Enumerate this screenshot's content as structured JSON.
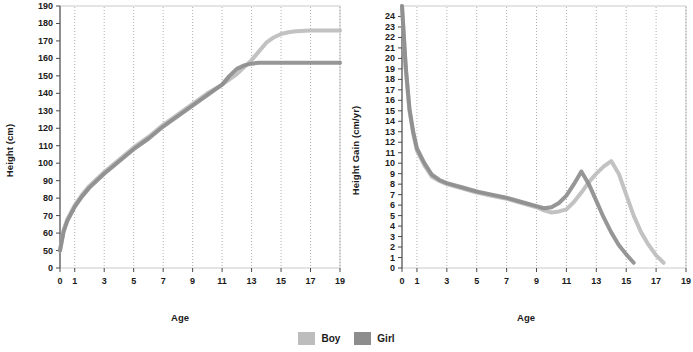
{
  "legend": {
    "items": [
      {
        "name": "Boy",
        "color": "#bdbdbd"
      },
      {
        "name": "Girl",
        "color": "#8d8d8d"
      }
    ]
  },
  "charts": [
    {
      "id": "height-chart",
      "ylabel": "Height (cm)",
      "xlabel": "Age"
    },
    {
      "id": "height-gain-chart",
      "ylabel": "Height Gain (cm/yr)",
      "xlabel": "Age"
    }
  ],
  "chart_data": [
    {
      "type": "line",
      "title": "",
      "xlabel": "Age",
      "ylabel": "Height (cm)",
      "xlim": [
        0,
        19
      ],
      "ylim": [
        0,
        195
      ],
      "yticks": [
        0,
        50,
        60,
        70,
        80,
        90,
        100,
        110,
        120,
        130,
        140,
        150,
        160,
        170,
        180,
        190
      ],
      "xticks": [
        0,
        1,
        3,
        5,
        7,
        9,
        11,
        13,
        15,
        17,
        19
      ],
      "grid": "vertical-dotted",
      "legend_position": "bottom-center",
      "x": [
        0,
        0.25,
        0.5,
        0.75,
        1,
        1.5,
        2,
        3,
        4,
        5,
        6,
        7,
        8,
        9,
        10,
        11,
        11.5,
        12,
        12.5,
        13,
        13.5,
        14,
        14.5,
        15,
        15.5,
        16,
        17,
        18,
        19
      ],
      "series": [
        {
          "name": "Boy",
          "color": "#bdbdbd",
          "values": [
            50,
            62,
            68,
            72,
            76,
            82,
            87,
            95,
            102,
            109,
            115,
            122,
            128,
            134,
            140,
            145,
            148,
            151,
            155,
            159,
            164,
            169,
            172,
            174,
            175,
            175.5,
            176,
            176,
            176
          ]
        },
        {
          "name": "Girl",
          "color": "#8d8d8d",
          "values": [
            50,
            61,
            67,
            71,
            75,
            81,
            86,
            94,
            101,
            108,
            114,
            121,
            127,
            133,
            139,
            145,
            150,
            154,
            156,
            157,
            157.5,
            157.5,
            157.5,
            157.5,
            157.5,
            157.5,
            157.5,
            157.5,
            157.5
          ]
        }
      ]
    },
    {
      "type": "line",
      "title": "",
      "xlabel": "Age",
      "ylabel": "Height Gain (cm/yr)",
      "xlim": [
        0,
        19
      ],
      "ylim": [
        0,
        25
      ],
      "yticks": [
        0,
        1,
        2,
        3,
        4,
        5,
        6,
        7,
        8,
        9,
        10,
        11,
        12,
        13,
        14,
        15,
        16,
        17,
        18,
        19,
        20,
        21,
        22,
        23,
        24
      ],
      "xticks": [
        0,
        1,
        3,
        5,
        7,
        9,
        11,
        13,
        15,
        17,
        19
      ],
      "grid": "vertical-dotted",
      "legend_position": "bottom-center",
      "x": [
        0,
        0.25,
        0.5,
        0.75,
        1,
        1.5,
        2,
        2.5,
        3,
        4,
        5,
        6,
        7,
        8,
        9,
        9.5,
        10,
        10.5,
        11,
        11.5,
        12,
        12.5,
        13,
        13.5,
        14,
        14.5,
        15,
        15.5,
        16,
        16.5,
        17,
        17.5
      ],
      "series": [
        {
          "name": "Boy",
          "color": "#bdbdbd",
          "values": [
            25,
            19,
            15,
            12.8,
            11.2,
            9.8,
            8.7,
            8.3,
            8.0,
            7.6,
            7.2,
            6.9,
            6.6,
            6.2,
            5.8,
            5.5,
            5.3,
            5.4,
            5.6,
            6.3,
            7.2,
            8.2,
            9.0,
            9.7,
            10.2,
            9.0,
            7.0,
            5.0,
            3.4,
            2.2,
            1.2,
            0.5
          ]
        },
        {
          "name": "Girl",
          "color": "#8d8d8d",
          "values": [
            25,
            19.2,
            15.2,
            13,
            11.4,
            10,
            8.9,
            8.4,
            8.1,
            7.7,
            7.3,
            7.0,
            6.7,
            6.3,
            5.9,
            5.7,
            5.8,
            6.2,
            6.9,
            8.0,
            9.2,
            8.0,
            6.4,
            4.8,
            3.4,
            2.2,
            1.3,
            0.5,
            null,
            null,
            null,
            null
          ]
        }
      ]
    }
  ]
}
